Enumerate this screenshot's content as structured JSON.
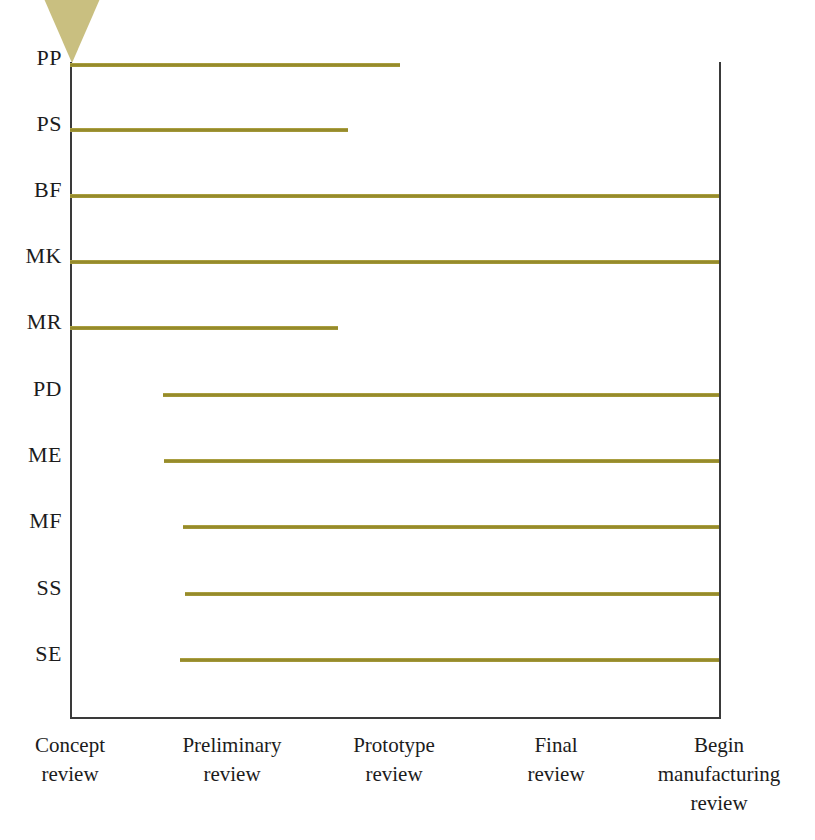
{
  "chart_data": {
    "type": "bar",
    "orientation": "horizontal",
    "title": "",
    "xlabel": "",
    "ylabel": "",
    "grid": false,
    "legend": null,
    "x_axis": {
      "type": "category",
      "ticks": [
        {
          "id": "concept",
          "line1": "Concept",
          "line2": "review",
          "line3": ""
        },
        {
          "id": "preliminary",
          "line1": "Preliminary",
          "line2": "review",
          "line3": ""
        },
        {
          "id": "prototype",
          "line1": "Prototype",
          "line2": "review",
          "line3": ""
        },
        {
          "id": "final",
          "line1": "Final",
          "line2": "review",
          "line3": ""
        },
        {
          "id": "begin-mfg",
          "line1": "Begin",
          "line2": "manufacturing",
          "line3": "review"
        }
      ],
      "tick_positions_px": [
        70,
        232,
        394,
        556,
        719
      ]
    },
    "y_axis": {
      "type": "category",
      "categories": [
        "PP",
        "PS",
        "BF",
        "MK",
        "MR",
        "PD",
        "ME",
        "MF",
        "SS",
        "SE"
      ]
    },
    "series_color": "#9a8f2e",
    "bars": [
      {
        "category": "PP",
        "start_stage": "Concept review",
        "end_stage": "between Prototype and Final review",
        "start_px": 70,
        "end_px": 400,
        "y_px": 63
      },
      {
        "category": "PS",
        "start_stage": "Concept review",
        "end_stage": "Prototype review",
        "start_px": 70,
        "end_px": 348,
        "y_px": 128
      },
      {
        "category": "BF",
        "start_stage": "Concept review",
        "end_stage": "Begin manufacturing review",
        "start_px": 70,
        "end_px": 719,
        "y_px": 194
      },
      {
        "category": "MK",
        "start_stage": "Concept review",
        "end_stage": "Begin manufacturing review",
        "start_px": 70,
        "end_px": 719,
        "y_px": 260
      },
      {
        "category": "MR",
        "start_stage": "Concept review",
        "end_stage": "Prototype review",
        "start_px": 70,
        "end_px": 338,
        "y_px": 326
      },
      {
        "category": "PD",
        "start_stage": "Preliminary review",
        "end_stage": "Begin manufacturing review",
        "start_px": 163,
        "end_px": 719,
        "y_px": 393
      },
      {
        "category": "ME",
        "start_stage": "Preliminary review",
        "end_stage": "Begin manufacturing review",
        "start_px": 164,
        "end_px": 719,
        "y_px": 459
      },
      {
        "category": "MF",
        "start_stage": "Preliminary review",
        "end_stage": "Begin manufacturing review",
        "start_px": 183,
        "end_px": 719,
        "y_px": 525
      },
      {
        "category": "SS",
        "start_stage": "Preliminary review",
        "end_stage": "Begin manufacturing review",
        "start_px": 185,
        "end_px": 719,
        "y_px": 592
      },
      {
        "category": "SE",
        "start_stage": "Preliminary review",
        "end_stage": "Begin manufacturing review",
        "start_px": 180,
        "end_px": 719,
        "y_px": 658
      }
    ]
  },
  "row_labels": [
    {
      "text": "PP",
      "top_px": 47
    },
    {
      "text": "PS",
      "top_px": 113
    },
    {
      "text": "BF",
      "top_px": 179
    },
    {
      "text": "MK",
      "top_px": 245
    },
    {
      "text": "MR",
      "top_px": 311
    },
    {
      "text": "PD",
      "top_px": 378
    },
    {
      "text": "ME",
      "top_px": 444
    },
    {
      "text": "MF",
      "top_px": 510
    },
    {
      "text": "SS",
      "top_px": 577
    },
    {
      "text": "SE",
      "top_px": 643
    }
  ],
  "xtick_labels": [
    {
      "line1": "Concept",
      "line2": "review",
      "line3": "",
      "center_px": 70,
      "width_px": 170
    },
    {
      "line1": "Preliminary",
      "line2": "review",
      "line3": "",
      "center_px": 232,
      "width_px": 180
    },
    {
      "line1": "Prototype",
      "line2": "review",
      "line3": "",
      "center_px": 394,
      "width_px": 170
    },
    {
      "line1": "Final",
      "line2": "review",
      "line3": "",
      "center_px": 556,
      "width_px": 150
    },
    {
      "line1": "Begin",
      "line2": "manufacturing",
      "line3": "review",
      "center_px": 719,
      "width_px": 200
    }
  ],
  "colors": {
    "bar": "#9a8f2e",
    "triangle": "#c9bf80",
    "axis": "#3a3a3a",
    "text": "#1c1c1c",
    "background": "#ffffff"
  }
}
